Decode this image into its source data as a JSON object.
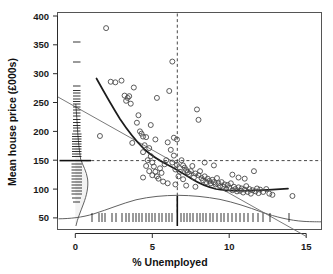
{
  "chart_data": {
    "type": "scatter",
    "title": "",
    "subtitle": "",
    "xlabel": "% Unemployed",
    "ylabel": "Mean house price (£000s)",
    "xlim": [
      -1.2,
      16.6
    ],
    "ylim": [
      36,
      412
    ],
    "x_ticks": [
      0,
      5,
      10,
      15
    ],
    "x_tick_labels": [
      "0",
      "5",
      "10",
      "15"
    ],
    "y_ticks": [
      50,
      100,
      150,
      200,
      250,
      300,
      350,
      400
    ],
    "y_tick_labels": [
      "50",
      "100",
      "150",
      "200",
      "250",
      "300",
      "350",
      "400"
    ],
    "grid": false,
    "legend": "none",
    "annotations": {
      "vertical_reference_x": 7.2,
      "horizontal_reference_y": 145,
      "reference_style": "dashed crosshair at medians"
    },
    "series": [
      {
        "name": "Districts",
        "marker": "open-circle",
        "points": [
          [
            2.0,
            379
          ],
          [
            1.6,
            192
          ],
          [
            2.3,
            286
          ],
          [
            2.6,
            285
          ],
          [
            3.0,
            288
          ],
          [
            3.2,
            262
          ],
          [
            3.4,
            258
          ],
          [
            3.3,
            253
          ],
          [
            3.6,
            248
          ],
          [
            3.5,
            261
          ],
          [
            3.8,
            276
          ],
          [
            4.0,
            215
          ],
          [
            3.7,
            180
          ],
          [
            4.2,
            200
          ],
          [
            4.3,
            196
          ],
          [
            4.4,
            191
          ],
          [
            4.6,
            190
          ],
          [
            4.5,
            176
          ],
          [
            4.8,
            171
          ],
          [
            4.4,
            164
          ],
          [
            4.9,
            157
          ],
          [
            4.7,
            150
          ],
          [
            5.0,
            146
          ],
          [
            4.6,
            140
          ],
          [
            5.1,
            139
          ],
          [
            4.8,
            131
          ],
          [
            5.0,
            124
          ],
          [
            4.4,
            120
          ],
          [
            5.3,
            122
          ],
          [
            5.5,
            136
          ],
          [
            5.2,
            130
          ],
          [
            5.6,
            128
          ],
          [
            5.4,
            118
          ],
          [
            5.8,
            143
          ],
          [
            5.9,
            150
          ],
          [
            5.3,
            258
          ],
          [
            6.1,
            270
          ],
          [
            6.0,
            181
          ],
          [
            6.2,
            168
          ],
          [
            6.4,
            158
          ],
          [
            6.3,
            146
          ],
          [
            6.6,
            142
          ],
          [
            6.5,
            134
          ],
          [
            6.8,
            130
          ],
          [
            6.7,
            122
          ],
          [
            6.3,
            321
          ],
          [
            6.4,
            189
          ],
          [
            6.6,
            186
          ],
          [
            6.9,
            150
          ],
          [
            7.0,
            141
          ],
          [
            7.1,
            137
          ],
          [
            7.2,
            133
          ],
          [
            7.3,
            129
          ],
          [
            7.4,
            126
          ],
          [
            7.0,
            117
          ],
          [
            7.6,
            140
          ],
          [
            7.5,
            131
          ],
          [
            7.8,
            127
          ],
          [
            7.7,
            120
          ],
          [
            8.0,
            124
          ],
          [
            8.1,
            131
          ],
          [
            8.2,
            119
          ],
          [
            8.3,
            115
          ],
          [
            8.4,
            122
          ],
          [
            8.5,
            112
          ],
          [
            7.9,
            238
          ],
          [
            8.0,
            220
          ],
          [
            8.6,
            118
          ],
          [
            8.7,
            114
          ],
          [
            8.8,
            110
          ],
          [
            8.9,
            116
          ],
          [
            9.0,
            112
          ],
          [
            9.1,
            108
          ],
          [
            9.2,
            119
          ],
          [
            9.3,
            110
          ],
          [
            9.4,
            105
          ],
          [
            9.5,
            112
          ],
          [
            9.6,
            104
          ],
          [
            9.7,
            108
          ],
          [
            9.8,
            100
          ],
          [
            9.9,
            107
          ],
          [
            10.0,
            102
          ],
          [
            10.1,
            110
          ],
          [
            10.2,
            98
          ],
          [
            10.3,
            104
          ],
          [
            10.4,
            100
          ],
          [
            10.5,
            96
          ],
          [
            10.6,
            103
          ],
          [
            10.7,
            97
          ],
          [
            10.8,
            101
          ],
          [
            10.9,
            94
          ],
          [
            11.0,
            99
          ],
          [
            11.1,
            105
          ],
          [
            11.2,
            95
          ],
          [
            11.3,
            100
          ],
          [
            11.4,
            92
          ],
          [
            11.5,
            98
          ],
          [
            11.6,
            131
          ],
          [
            11.7,
            96
          ],
          [
            11.8,
            101
          ],
          [
            11.9,
            93
          ],
          [
            12.0,
            99
          ],
          [
            12.2,
            95
          ],
          [
            12.4,
            100
          ],
          [
            12.6,
            92
          ],
          [
            5.7,
            113
          ],
          [
            6.0,
            110
          ],
          [
            6.5,
            108
          ],
          [
            7.2,
            106
          ],
          [
            7.8,
            104
          ],
          [
            14.1,
            88
          ],
          [
            12.8,
            90
          ],
          [
            9.0,
            141
          ],
          [
            8.4,
            146
          ],
          [
            10.2,
            125
          ],
          [
            10.6,
            120
          ],
          [
            11.0,
            118
          ],
          [
            5.2,
            186
          ],
          [
            4.9,
            211
          ],
          [
            4.1,
            228
          ]
        ]
      }
    ],
    "fits": [
      {
        "name": "loess smoother",
        "style": "thick dark curve"
      },
      {
        "name": "linear regression",
        "style": "thin grey straight line"
      }
    ],
    "marginals": {
      "x_rug": "dense tick marks along bottom axis",
      "y_rug": "dense tick marks along left axis",
      "x_density": "unimodal density curve peaking near 7%",
      "y_density": "right-skewed density curve peaking near 110"
    }
  }
}
